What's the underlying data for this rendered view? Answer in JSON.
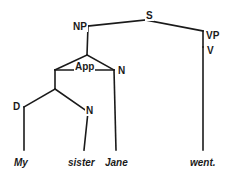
{
  "diagram": {
    "type": "syntax-tree",
    "sentence": "My sister Jane went.",
    "line_color": "#1a1a1a",
    "background_color": "#ffffff",
    "nodes": [
      {
        "id": "s",
        "label": "S",
        "x": 145,
        "y": 11
      },
      {
        "id": "np",
        "label": "NP",
        "x": 72,
        "y": 22
      },
      {
        "id": "vp",
        "label": "VP",
        "x": 205,
        "y": 31
      },
      {
        "id": "v",
        "label": "V",
        "x": 206,
        "y": 46
      },
      {
        "id": "app",
        "label": "App",
        "x": 74,
        "y": 62
      },
      {
        "id": "n-outer",
        "label": "N",
        "x": 117,
        "y": 66
      },
      {
        "id": "d",
        "label": "D",
        "x": 12,
        "y": 102
      },
      {
        "id": "n-inner",
        "label": "N",
        "x": 85,
        "y": 106
      }
    ],
    "words": [
      {
        "id": "word-my",
        "label": "My",
        "x": 14,
        "y": 158
      },
      {
        "id": "word-sister",
        "label": "sister",
        "x": 68,
        "y": 158
      },
      {
        "id": "word-jane",
        "label": "Jane",
        "x": 105,
        "y": 158
      },
      {
        "id": "word-went",
        "label": "went.",
        "x": 190,
        "y": 158
      }
    ],
    "edges": [
      {
        "id": "edge-s-np",
        "x1": 146,
        "y1": 20,
        "x2": 88,
        "y2": 26
      },
      {
        "id": "edge-s-vp",
        "x1": 146,
        "y1": 20,
        "x2": 203,
        "y2": 31
      },
      {
        "id": "edge-np-app-apex",
        "x1": 88,
        "y1": 26,
        "x2": 87,
        "y2": 55
      },
      {
        "id": "edge-vp-v",
        "x1": 203,
        "y1": 31,
        "x2": 203,
        "y2": 47
      },
      {
        "id": "edge-v-went",
        "x1": 203,
        "y1": 47,
        "x2": 203,
        "y2": 150
      },
      {
        "id": "edge-app-left",
        "x1": 87,
        "y1": 55,
        "x2": 55,
        "y2": 70
      },
      {
        "id": "edge-app-right",
        "x1": 87,
        "y1": 55,
        "x2": 114,
        "y2": 70
      },
      {
        "id": "edge-app-base",
        "x1": 55,
        "y1": 70,
        "x2": 114,
        "y2": 70
      },
      {
        "id": "edge-innernp-stem",
        "x1": 55,
        "y1": 70,
        "x2": 55,
        "y2": 89
      },
      {
        "id": "edge-innernp-d",
        "x1": 55,
        "y1": 89,
        "x2": 24,
        "y2": 107
      },
      {
        "id": "edge-innernp-n",
        "x1": 55,
        "y1": 89,
        "x2": 88,
        "y2": 112
      },
      {
        "id": "edge-d-my",
        "x1": 24,
        "y1": 107,
        "x2": 24,
        "y2": 150
      },
      {
        "id": "edge-n-sister",
        "x1": 88,
        "y1": 112,
        "x2": 84,
        "y2": 150
      },
      {
        "id": "edge-nouter-jane",
        "x1": 114,
        "y1": 70,
        "x2": 116,
        "y2": 150
      }
    ]
  }
}
